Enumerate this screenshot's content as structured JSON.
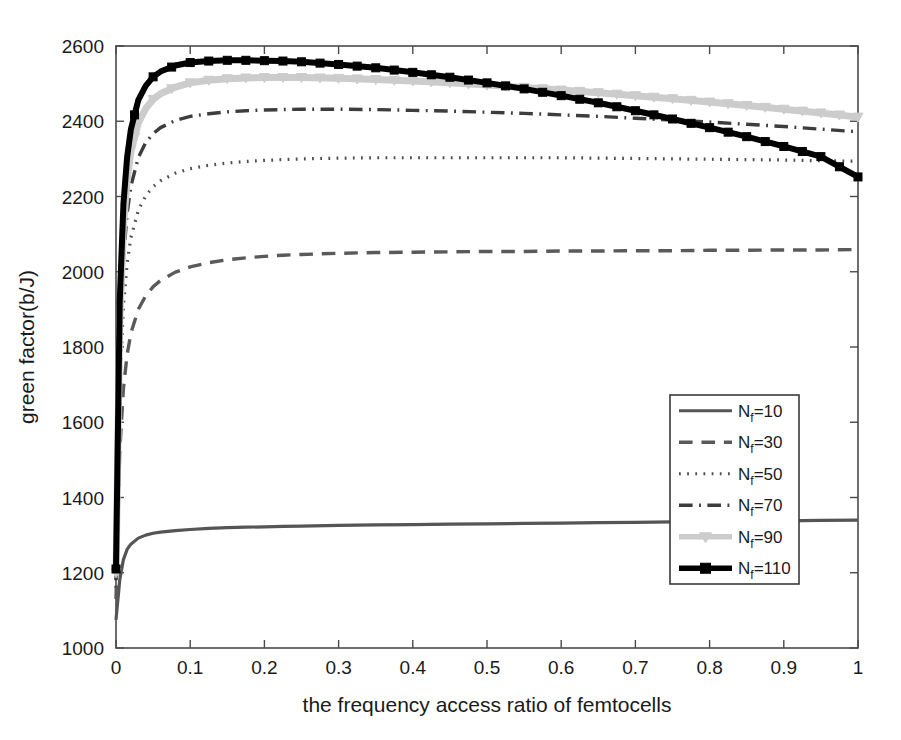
{
  "chart_data": {
    "type": "line",
    "title": "",
    "xlabel": "the frequency access ratio of femtocells",
    "ylabel": "green factor(b/J)",
    "xlim": [
      0,
      1
    ],
    "ylim": [
      1000,
      2600
    ],
    "xticks": [
      "0",
      "0.1",
      "0.2",
      "0.3",
      "0.4",
      "0.5",
      "0.6",
      "0.7",
      "0.8",
      "0.9",
      "1"
    ],
    "xtick_values": [
      0,
      0.1,
      0.2,
      0.3,
      0.4,
      0.5,
      0.6,
      0.7,
      0.8,
      0.9,
      1
    ],
    "yticks": [
      "1000",
      "1200",
      "1400",
      "1600",
      "1800",
      "2000",
      "2200",
      "2400",
      "2600"
    ],
    "ytick_values": [
      1000,
      1200,
      1400,
      1600,
      1800,
      2000,
      2200,
      2400,
      2600
    ],
    "grid": false,
    "legend_position": "center-right",
    "x": [
      0,
      0.005,
      0.01,
      0.015,
      0.02,
      0.03,
      0.04,
      0.05,
      0.06,
      0.08,
      0.1,
      0.125,
      0.15,
      0.175,
      0.2,
      0.225,
      0.25,
      0.3,
      0.35,
      0.4,
      0.45,
      0.5,
      0.55,
      0.6,
      0.65,
      0.7,
      0.75,
      0.8,
      0.85,
      0.9,
      0.95,
      1
    ],
    "series": [
      {
        "name": "N_f=10",
        "label": "N",
        "sub": "f",
        "suffix": "=10",
        "style": "solid",
        "color": "#555555",
        "width": 3.2,
        "marker": "none",
        "values": [
          1075,
          1180,
          1235,
          1262,
          1276,
          1292,
          1300,
          1305,
          1308,
          1312,
          1315,
          1318,
          1320,
          1321,
          1322,
          1323,
          1324,
          1326,
          1327,
          1328,
          1329,
          1330,
          1331,
          1332,
          1333,
          1334,
          1335,
          1336,
          1337,
          1338,
          1339,
          1340
        ]
      },
      {
        "name": "N_f=30",
        "label": "N",
        "sub": "f",
        "suffix": "=30",
        "style": "dashed",
        "color": "#5a5a5a",
        "width": 3.4,
        "marker": "none",
        "values": [
          1130,
          1520,
          1690,
          1780,
          1836,
          1900,
          1936,
          1960,
          1977,
          1999,
          2013,
          2024,
          2032,
          2037,
          2041,
          2044,
          2046,
          2049,
          2051,
          2052,
          2053,
          2054,
          2054,
          2055,
          2055,
          2056,
          2056,
          2057,
          2057,
          2058,
          2058,
          2059
        ]
      },
      {
        "name": "N_f=50",
        "label": "N",
        "sub": "f",
        "suffix": "=50",
        "style": "dotted",
        "color": "#4d4d4d",
        "width": 3.2,
        "marker": "none",
        "values": [
          1160,
          1690,
          1910,
          2022,
          2090,
          2163,
          2202,
          2226,
          2242,
          2262,
          2274,
          2283,
          2289,
          2293,
          2296,
          2298,
          2300,
          2302,
          2303,
          2303,
          2303,
          2303,
          2303,
          2303,
          2302,
          2301,
          2300,
          2299,
          2298,
          2297,
          2295,
          2294
        ]
      },
      {
        "name": "N_f=70",
        "label": "N",
        "sub": "f",
        "suffix": "=70",
        "style": "dashdot",
        "color": "#3d3d3d",
        "width": 3.4,
        "marker": "none",
        "values": [
          1180,
          1790,
          2035,
          2155,
          2227,
          2303,
          2343,
          2367,
          2383,
          2402,
          2413,
          2420,
          2425,
          2428,
          2430,
          2431,
          2432,
          2432,
          2431,
          2429,
          2427,
          2424,
          2421,
          2417,
          2413,
          2408,
          2403,
          2398,
          2392,
          2386,
          2379,
          2372
        ]
      },
      {
        "name": "N_f=90",
        "label": "N",
        "sub": "f",
        "suffix": "=90",
        "style": "solid",
        "color": "#cccccc",
        "width": 7,
        "marker": "triangle",
        "values": [
          1200,
          1865,
          2120,
          2245,
          2318,
          2395,
          2434,
          2458,
          2473,
          2491,
          2502,
          2509,
          2513,
          2515,
          2516,
          2516,
          2516,
          2514,
          2511,
          2507,
          2502,
          2496,
          2490,
          2483,
          2476,
          2468,
          2460,
          2451,
          2442,
          2432,
          2422,
          2411
        ]
      },
      {
        "name": "N_f=110",
        "label": "N",
        "sub": "f",
        "suffix": "=110",
        "style": "solid",
        "color": "#000000",
        "width": 6,
        "marker": "square",
        "values": [
          1210,
          1920,
          2180,
          2305,
          2378,
          2456,
          2494,
          2518,
          2532,
          2548,
          2556,
          2560,
          2562,
          2562,
          2561,
          2560,
          2558,
          2551,
          2542,
          2530,
          2517,
          2502,
          2486,
          2468,
          2449,
          2428,
          2406,
          2383,
          2359,
          2333,
          2306,
          2252
        ]
      }
    ]
  },
  "axes": {
    "xlabel": "the frequency access ratio of femtocells",
    "ylabel": "green factor(b/J)"
  }
}
